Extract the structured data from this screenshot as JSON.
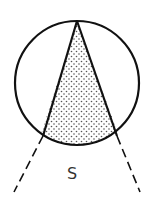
{
  "diagram": {
    "type": "geometric-figure",
    "label": "S",
    "colors": {
      "stroke": "#111111",
      "fill_dots": "#555555",
      "background": "#ffffff",
      "label": "#333333"
    },
    "circle": {
      "cx": 77,
      "cy": 83,
      "r": 62
    },
    "triangle": {
      "apex": [
        77,
        21
      ],
      "base_left": [
        43,
        136
      ],
      "base_right": [
        117,
        136
      ],
      "shading": "dotted"
    },
    "dashed_extensions": [
      {
        "from": [
          43,
          136
        ],
        "to": [
          14,
          192
        ]
      },
      {
        "from": [
          117,
          136
        ],
        "to": [
          140,
          192
        ]
      }
    ],
    "label_position": [
      72,
      178
    ]
  }
}
